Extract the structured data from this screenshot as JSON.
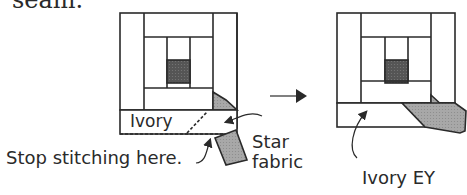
{
  "diagram": {
    "top_text_fragment": "seam.",
    "before_block": {
      "strip_label": "Ivory",
      "callout_stop": "Stop stitching here.",
      "callout_star_line1": "Star",
      "callout_star_line2": "fabric"
    },
    "transition": {
      "arrow": "right-arrow-icon"
    },
    "after_block": {
      "callout_ivory_ey": "Ivory EY"
    },
    "colors": {
      "line": "#2a2a2a",
      "center_square": "#555555",
      "star_fabric": "#a8a8a8",
      "fabric_fill": "#ffffff"
    }
  }
}
